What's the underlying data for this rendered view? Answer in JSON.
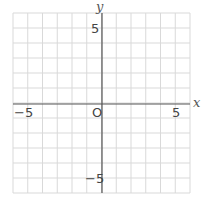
{
  "chart_data": {
    "type": "scatter",
    "title": "",
    "xlabel": "x",
    "ylabel": "y",
    "xlim": [
      -6,
      6
    ],
    "ylim": [
      -6,
      6
    ],
    "grid": true,
    "grid_step": 1,
    "x_ticks_labeled": [
      -5,
      5
    ],
    "y_ticks_labeled": [
      5,
      -5
    ],
    "origin_label": "O",
    "series": [],
    "legend": null
  },
  "labels": {
    "x_axis": "x",
    "y_axis": "y",
    "origin": "O",
    "x_neg": "−5",
    "x_pos": "5",
    "y_pos": "5",
    "y_neg": "−5"
  },
  "colors": {
    "grid": "#d9d9d9",
    "axis": "#555555",
    "text": "#444444"
  }
}
